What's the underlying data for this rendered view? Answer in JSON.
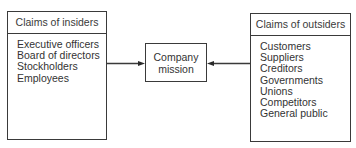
{
  "diagram": {
    "insiders": {
      "title": "Claims of insiders",
      "items": [
        "Executive officers",
        "Board of directors",
        "Stockholders",
        "Employees"
      ]
    },
    "center": {
      "line1": "Company",
      "line2": "mission"
    },
    "outsiders": {
      "title": "Claims of outsiders",
      "items": [
        "Customers",
        "Suppliers",
        "Creditors",
        "Governments",
        "Unions",
        "Competitors",
        "General public"
      ]
    },
    "arrows": [
      {
        "from": "insiders",
        "to": "center"
      },
      {
        "from": "outsiders",
        "to": "center"
      }
    ]
  }
}
